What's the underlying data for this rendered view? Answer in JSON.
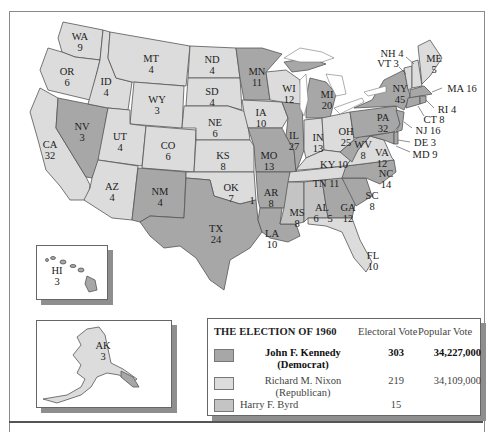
{
  "title": "THE ELECTION OF 1960",
  "legend": {
    "title": "THE ELECTION OF 1960",
    "col_electoral": "Electoral Vote",
    "col_popular": "Popular Vote",
    "rows": [
      {
        "name": "John F. Kennedy",
        "party": "(Democrat)",
        "electoral": "303",
        "popular": "34,227,000",
        "color": "#a7a7a7",
        "bold": true
      },
      {
        "name": "Richard M. Nixon",
        "party": "(Republican)",
        "electoral": "219",
        "popular": "34,109,000",
        "color": "#dcdcdc",
        "bold": false
      },
      {
        "name": "Harry F. Byrd",
        "party": "",
        "electoral": "15",
        "popular": "",
        "color": "#c4c4c4",
        "bold": false
      }
    ]
  },
  "colors": {
    "kennedy": "#a7a7a7",
    "nixon": "#dcdcdc",
    "byrd": "#c4c4c4",
    "border": "#555555",
    "shadow": "#8e8e8e"
  },
  "states": {
    "WA": {
      "abbr": "WA",
      "ev": "9",
      "winner": "Nixon"
    },
    "OR": {
      "abbr": "OR",
      "ev": "6",
      "winner": "Nixon"
    },
    "CA": {
      "abbr": "CA",
      "ev": "32",
      "winner": "Nixon"
    },
    "ID": {
      "abbr": "ID",
      "ev": "4",
      "winner": "Nixon"
    },
    "NV": {
      "abbr": "NV",
      "ev": "3",
      "winner": "Kennedy"
    },
    "MT": {
      "abbr": "MT",
      "ev": "4",
      "winner": "Nixon"
    },
    "WY": {
      "abbr": "WY",
      "ev": "3",
      "winner": "Nixon"
    },
    "UT": {
      "abbr": "UT",
      "ev": "4",
      "winner": "Nixon"
    },
    "AZ": {
      "abbr": "AZ",
      "ev": "4",
      "winner": "Nixon"
    },
    "CO": {
      "abbr": "CO",
      "ev": "6",
      "winner": "Nixon"
    },
    "NM": {
      "abbr": "NM",
      "ev": "4",
      "winner": "Kennedy"
    },
    "ND": {
      "abbr": "ND",
      "ev": "4",
      "winner": "Nixon"
    },
    "SD": {
      "abbr": "SD",
      "ev": "4",
      "winner": "Nixon"
    },
    "NE": {
      "abbr": "NE",
      "ev": "6",
      "winner": "Nixon"
    },
    "KS": {
      "abbr": "KS",
      "ev": "8",
      "winner": "Nixon"
    },
    "OK": {
      "abbr": "OK",
      "ev": "7",
      "byrd_ev": "1",
      "winner": "Nixon"
    },
    "TX": {
      "abbr": "TX",
      "ev": "24",
      "winner": "Kennedy"
    },
    "MN": {
      "abbr": "MN",
      "ev": "11",
      "winner": "Kennedy"
    },
    "IA": {
      "abbr": "IA",
      "ev": "10",
      "winner": "Nixon"
    },
    "MO": {
      "abbr": "MO",
      "ev": "13",
      "winner": "Kennedy"
    },
    "AR": {
      "abbr": "AR",
      "ev": "8",
      "winner": "Kennedy"
    },
    "LA": {
      "abbr": "LA",
      "ev": "10",
      "winner": "Kennedy"
    },
    "WI": {
      "abbr": "WI",
      "ev": "12",
      "winner": "Nixon"
    },
    "IL": {
      "abbr": "IL",
      "ev": "27",
      "winner": "Kennedy"
    },
    "MI": {
      "abbr": "MI",
      "ev": "20",
      "winner": "Kennedy"
    },
    "IN": {
      "abbr": "IN",
      "ev": "13",
      "winner": "Nixon"
    },
    "OH": {
      "abbr": "OH",
      "ev": "25",
      "winner": "Nixon"
    },
    "KY": {
      "abbr": "KY",
      "ev": "10",
      "winner": "Nixon"
    },
    "TN": {
      "abbr": "TN",
      "ev": "11",
      "winner": "Nixon"
    },
    "MS": {
      "abbr": "MS",
      "ev": "8",
      "winner": "Byrd"
    },
    "AL": {
      "abbr": "AL",
      "ev": "6",
      "ev2": "5",
      "winner": "Split"
    },
    "GA": {
      "abbr": "GA",
      "ev": "12",
      "winner": "Kennedy"
    },
    "FL": {
      "abbr": "FL",
      "ev": "10",
      "winner": "Nixon"
    },
    "SC": {
      "abbr": "SC",
      "ev": "8",
      "winner": "Kennedy"
    },
    "NC": {
      "abbr": "NC",
      "ev": "14",
      "winner": "Kennedy"
    },
    "VA": {
      "abbr": "VA",
      "ev": "12",
      "winner": "Nixon"
    },
    "WV": {
      "abbr": "WV",
      "ev": "8",
      "winner": "Kennedy"
    },
    "PA": {
      "abbr": "PA",
      "ev": "32",
      "winner": "Kennedy"
    },
    "NY": {
      "abbr": "NY",
      "ev": "45",
      "winner": "Kennedy"
    },
    "ME": {
      "abbr": "ME",
      "ev": "5",
      "winner": "Nixon"
    },
    "NH": {
      "label": "NH 4",
      "winner": "Nixon"
    },
    "VT": {
      "label": "VT 3",
      "winner": "Nixon"
    },
    "MA": {
      "label": "MA 16",
      "winner": "Kennedy"
    },
    "RI": {
      "label": "RI 4",
      "winner": "Kennedy"
    },
    "CT": {
      "label": "CT 8",
      "winner": "Kennedy"
    },
    "NJ": {
      "label": "NJ 16",
      "winner": "Kennedy"
    },
    "DE": {
      "label": "DE 3",
      "winner": "Kennedy"
    },
    "MD": {
      "label": "MD 9",
      "winner": "Kennedy"
    },
    "HI": {
      "abbr": "HI",
      "ev": "3",
      "winner": "Kennedy"
    },
    "AK": {
      "abbr": "AK",
      "ev": "3",
      "winner": "Nixon"
    }
  }
}
